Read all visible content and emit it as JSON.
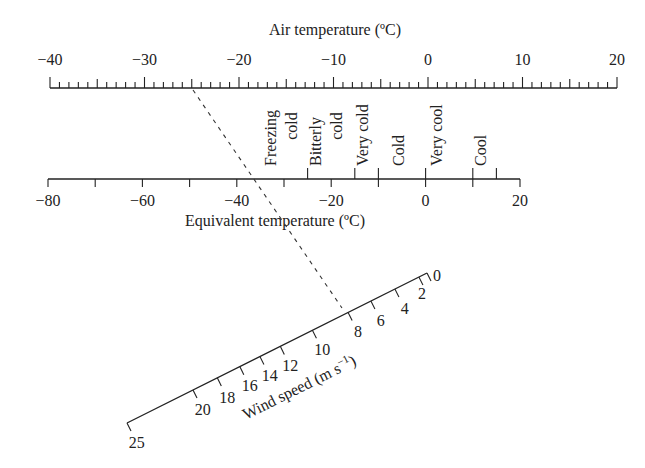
{
  "figure": {
    "type": "nomogram"
  },
  "air_temperature_axis": {
    "title": "Air temperature (ºC)",
    "min": -40,
    "max": 20,
    "labels": [
      "−40",
      "−30",
      "−20",
      "−10",
      "0",
      "10",
      "20"
    ],
    "label_values": [
      -40,
      -30,
      -20,
      -10,
      0,
      10,
      20
    ],
    "minor_tick_step": 1,
    "medium_tick_step": 5,
    "major_tick_step": 10
  },
  "equivalent_temperature_axis": {
    "title": "Equivalent temperature (ºC)",
    "min": -80,
    "max": 20,
    "labels": [
      "−80",
      "−60",
      "−40",
      "−20",
      "0",
      "20"
    ],
    "label_values": [
      -80,
      -60,
      -40,
      -20,
      0,
      20
    ],
    "tick_values": [
      -80,
      -70,
      -60,
      -50,
      -40,
      -30,
      -20,
      -10,
      0,
      10,
      20
    ],
    "category_boundaries": [
      -25,
      -15,
      -10,
      0,
      10,
      15
    ],
    "categories": [
      {
        "lines": [
          "Freezing",
          "cold"
        ],
        "range": "below -25"
      },
      {
        "lines": [
          "Bitterly",
          "cold"
        ],
        "range": "-25 to -15"
      },
      {
        "lines": [
          "Very cold"
        ],
        "range": "-15 to -10"
      },
      {
        "lines": [
          "Cold"
        ],
        "range": "-10 to 0"
      },
      {
        "lines": [
          "Very cool"
        ],
        "range": "0 to 10"
      },
      {
        "lines": [
          "Cool"
        ],
        "range": "10 to 15"
      }
    ]
  },
  "wind_speed_axis": {
    "title": "Wind speed (m s⁻¹)",
    "title_main": "Wind speed (m s",
    "title_sup": "−1",
    "title_end": ")",
    "ticks": [
      {
        "value": 0,
        "label": "0",
        "pos": 0.0
      },
      {
        "value": 2,
        "label": "2",
        "pos": 0.027
      },
      {
        "value": 4,
        "label": "4",
        "pos": 0.107
      },
      {
        "value": 6,
        "label": "6",
        "pos": 0.187
      },
      {
        "value": 8,
        "label": "8",
        "pos": 0.263
      },
      {
        "value": 10,
        "label": "10",
        "pos": 0.382
      },
      {
        "value": 12,
        "label": "12",
        "pos": 0.489
      },
      {
        "value": 14,
        "label": "14",
        "pos": 0.557
      },
      {
        "value": 16,
        "label": "16",
        "pos": 0.624
      },
      {
        "value": 18,
        "label": "18",
        "pos": 0.699
      },
      {
        "value": 20,
        "label": "20",
        "pos": 0.78
      },
      {
        "value": 25,
        "label": "25",
        "pos": 1.0
      }
    ]
  },
  "example_line": {
    "air_temperature": -25,
    "wind_speed": 7.7,
    "equivalent_temperature": -36.6,
    "style": "dashed"
  },
  "colors": {
    "ink": "#222222",
    "background": "#ffffff"
  }
}
